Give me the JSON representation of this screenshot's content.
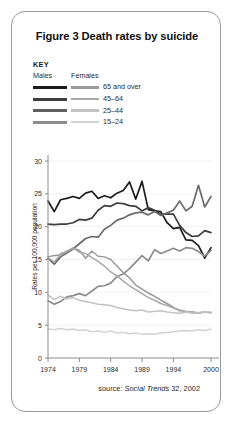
{
  "card": {
    "title": "Figure 3 Death rates by suicide",
    "source_prefix": "source: ",
    "source_italic": "Social Trends",
    "source_suffix": " 32, 2002"
  },
  "legend": {
    "key_label": "KEY",
    "col_males": "Males",
    "col_females": "Females",
    "rows": [
      {
        "label": "65 and over",
        "males_color": "#1c1c1c",
        "females_color": "#9a9a9a"
      },
      {
        "label": "45–64",
        "males_color": "#3d3d3d",
        "females_color": "#a8a8a8"
      },
      {
        "label": "25–44",
        "males_color": "#5f5f5f",
        "females_color": "#c2c2c2"
      },
      {
        "label": "15–24",
        "males_color": "#8c8c8c",
        "females_color": "#d2d2d2"
      }
    ]
  },
  "chart_data": {
    "type": "line",
    "title": "Figure 3 Death rates by suicide",
    "xlabel": "",
    "ylabel": "Rates per 100,000 population",
    "ylim": [
      0,
      30
    ],
    "ytick_step": 5,
    "yticks": [
      0,
      5,
      10,
      15,
      20,
      25,
      30
    ],
    "grid": true,
    "legend_position": "above-plot",
    "xlim": [
      1974,
      2000
    ],
    "xticks": [
      1974,
      1979,
      1984,
      1989,
      1994,
      2000
    ],
    "x": [
      1974,
      1975,
      1976,
      1977,
      1978,
      1979,
      1980,
      1981,
      1982,
      1983,
      1984,
      1985,
      1986,
      1987,
      1988,
      1989,
      1990,
      1991,
      1992,
      1993,
      1994,
      1995,
      1996,
      1997,
      1998,
      1999,
      2000
    ],
    "series": [
      {
        "name": "Males 65 and over",
        "color": "#1c1c1c",
        "width": 1.7,
        "values": [
          23.9,
          22.3,
          24.1,
          24.3,
          24.6,
          24.3,
          25.1,
          25.4,
          24.3,
          24.7,
          24.4,
          25.1,
          25.5,
          26.8,
          24.2,
          26.9,
          22.6,
          22.4,
          22.3,
          20.6,
          19.7,
          19.9,
          18.0,
          17.9,
          17.1,
          15.2,
          16.8
        ]
      },
      {
        "name": "Males 45–64",
        "color": "#3d3d3d",
        "width": 1.7,
        "values": [
          20.4,
          20.3,
          20.4,
          20.4,
          20.6,
          21.1,
          21.0,
          21.3,
          22.5,
          23.2,
          23.1,
          23.6,
          23.5,
          23.2,
          23.1,
          22.4,
          22.9,
          22.5,
          21.9,
          21.9,
          21.9,
          20.2,
          19.1,
          18.5,
          18.6,
          19.4,
          19.1
        ]
      },
      {
        "name": "Males 25–44",
        "color": "#6b6b6b",
        "width": 1.7,
        "values": [
          15.2,
          14.3,
          15.4,
          16.0,
          16.6,
          17.4,
          18.2,
          18.5,
          18.4,
          19.6,
          20.2,
          21.0,
          21.3,
          21.8,
          22.1,
          22.2,
          21.8,
          22.3,
          21.7,
          22.1,
          22.5,
          23.9,
          22.4,
          23.1,
          26.3,
          23.0,
          24.6
        ]
      },
      {
        "name": "Males 15–24",
        "color": "#8c8c8c",
        "width": 1.7,
        "values": [
          8.7,
          8.2,
          8.6,
          9.3,
          9.5,
          9.8,
          9.5,
          10.2,
          10.9,
          11.0,
          11.4,
          12.4,
          12.8,
          13.6,
          14.6,
          15.6,
          14.8,
          16.5,
          15.9,
          16.3,
          16.7,
          16.3,
          16.8,
          16.7,
          16.2,
          15.5,
          16.4
        ]
      },
      {
        "name": "Females 65 and over",
        "color": "#9a9a9a",
        "width": 1.5,
        "values": [
          15.4,
          15.6,
          15.7,
          16.3,
          16.7,
          16.4,
          15.2,
          16.3,
          15.5,
          15.4,
          15.0,
          14.0,
          13.0,
          12.2,
          11.1,
          10.5,
          9.9,
          9.4,
          8.8,
          8.3,
          7.7,
          7.2,
          7.1,
          7.0,
          6.8,
          7.0,
          6.9
        ]
      },
      {
        "name": "Females 45–64",
        "color": "#a8a8a8",
        "width": 1.5,
        "values": [
          15.3,
          14.6,
          15.9,
          16.2,
          16.8,
          16.1,
          15.9,
          15.3,
          14.7,
          14.0,
          13.1,
          12.5,
          11.7,
          11.0,
          10.4,
          9.8,
          9.2,
          8.8,
          8.3,
          8.0,
          7.6,
          7.3,
          7.1,
          7.0,
          6.9,
          7.0,
          6.9
        ]
      },
      {
        "name": "Females 25–44",
        "color": "#c2c2c2",
        "width": 1.5,
        "values": [
          9.6,
          8.9,
          9.4,
          9.0,
          9.2,
          8.8,
          8.6,
          8.4,
          8.2,
          8.1,
          8.0,
          7.7,
          7.5,
          7.3,
          7.2,
          7.3,
          7.0,
          7.1,
          7.2,
          7.0,
          6.9,
          6.8,
          7.0,
          6.8,
          6.9,
          7.0,
          7.0
        ]
      },
      {
        "name": "Females 15–24",
        "color": "#d2d2d2",
        "width": 1.5,
        "values": [
          4.4,
          4.3,
          4.5,
          4.3,
          4.4,
          4.2,
          4.3,
          4.0,
          4.1,
          3.9,
          4.1,
          3.8,
          3.9,
          3.7,
          3.8,
          3.6,
          3.7,
          3.6,
          3.8,
          3.9,
          4.0,
          4.1,
          4.2,
          4.1,
          4.3,
          4.2,
          4.4
        ]
      }
    ]
  }
}
